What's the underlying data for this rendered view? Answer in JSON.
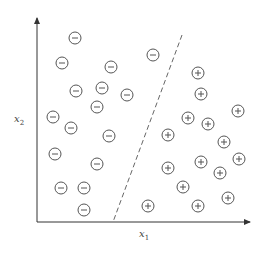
{
  "diagram": {
    "type": "linear-classifier-scatter",
    "axes": {
      "x_label": "x",
      "x_sub": "1",
      "y_label": "x",
      "y_sub": "2",
      "origin": [
        37,
        222
      ],
      "x_end": [
        250,
        222
      ],
      "y_end": [
        37,
        18
      ]
    },
    "decision_boundary": {
      "style": "dashed",
      "from": [
        182,
        35
      ],
      "to": [
        113,
        222
      ]
    },
    "colors": {
      "stroke": "#555555",
      "axis": "#333333",
      "boundary": "#666666"
    },
    "negative_points": [
      [
        75,
        38
      ],
      [
        62,
        63
      ],
      [
        111,
        67
      ],
      [
        153,
        55
      ],
      [
        76,
        91
      ],
      [
        127,
        95
      ],
      [
        102,
        88
      ],
      [
        97,
        107
      ],
      [
        53,
        117
      ],
      [
        71,
        128
      ],
      [
        109,
        136
      ],
      [
        55,
        154
      ],
      [
        97,
        164
      ],
      [
        61,
        188
      ],
      [
        84,
        188
      ],
      [
        84,
        210
      ]
    ],
    "positive_points": [
      [
        198,
        73
      ],
      [
        201,
        94
      ],
      [
        238,
        111
      ],
      [
        188,
        118
      ],
      [
        208,
        124
      ],
      [
        168,
        135
      ],
      [
        224,
        142
      ],
      [
        201,
        162
      ],
      [
        239,
        159
      ],
      [
        168,
        168
      ],
      [
        220,
        173
      ],
      [
        183,
        187
      ],
      [
        228,
        198
      ],
      [
        148,
        206
      ],
      [
        198,
        206
      ]
    ],
    "negative_symbol": "−",
    "positive_symbol": "+"
  }
}
